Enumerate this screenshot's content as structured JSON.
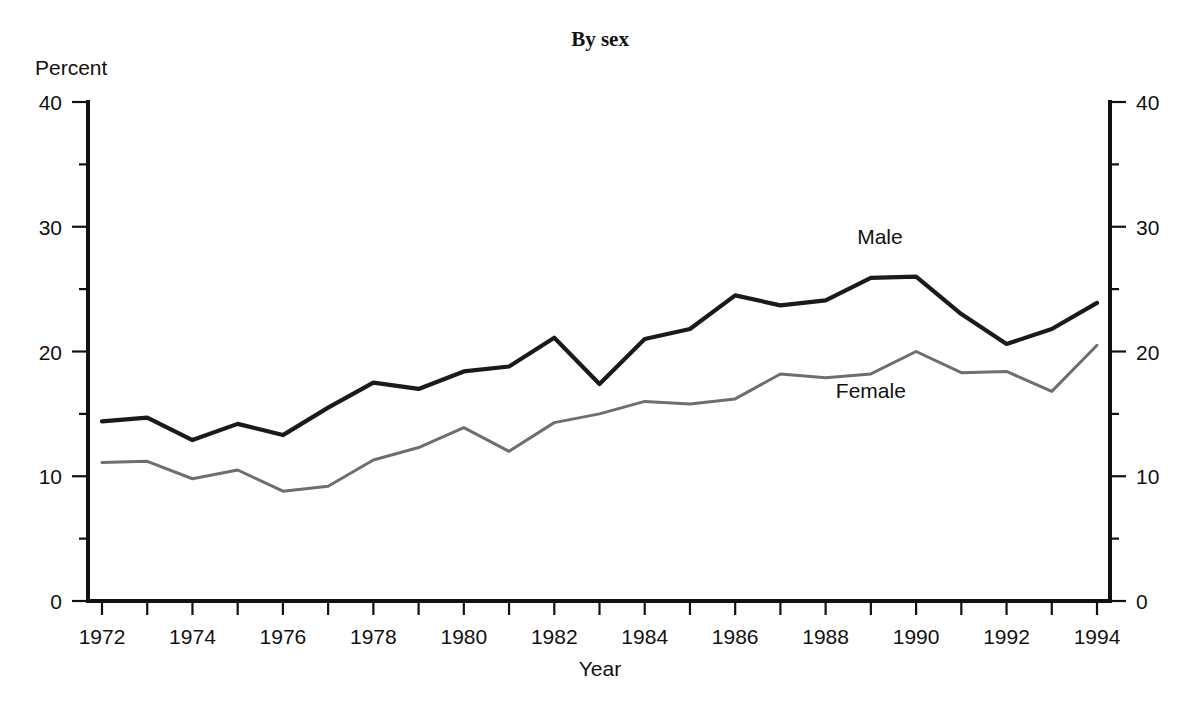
{
  "chart_data": {
    "type": "line",
    "title": "By sex",
    "xlabel": "Year",
    "ylabel": "Percent",
    "ylim": [
      0,
      40
    ],
    "xlim": [
      1972,
      1994
    ],
    "grid": false,
    "legend_position": "inline-annotations",
    "y_ticks_major": [
      0,
      10,
      20,
      30,
      40
    ],
    "y_ticks_minor": [
      5,
      15,
      25,
      35
    ],
    "y_tick_labels": [
      "0",
      "10",
      "20",
      "30",
      "40"
    ],
    "y_axis_right_labels": [
      "0",
      "10",
      "20",
      "30",
      "40"
    ],
    "x_ticks": [
      1972,
      1973,
      1974,
      1975,
      1976,
      1977,
      1978,
      1979,
      1980,
      1981,
      1982,
      1983,
      1984,
      1985,
      1986,
      1987,
      1988,
      1989,
      1990,
      1991,
      1992,
      1993,
      1994
    ],
    "x_tick_labels": [
      "1972",
      "",
      "1974",
      "",
      "1976",
      "",
      "1978",
      "",
      "1980",
      "",
      "1982",
      "",
      "1984",
      "",
      "1986",
      "",
      "1988",
      "",
      "1990",
      "",
      "1992",
      "",
      "1994"
    ],
    "x": [
      1972,
      1973,
      1974,
      1975,
      1976,
      1977,
      1978,
      1979,
      1980,
      1981,
      1982,
      1983,
      1984,
      1985,
      1986,
      1987,
      1988,
      1989,
      1990,
      1991,
      1992,
      1993,
      1994
    ],
    "series": [
      {
        "name": "Male",
        "color": "#1a1a1a",
        "width": 4.2,
        "label_x": 1989.2,
        "label_y": 28.6,
        "values": [
          14.4,
          14.7,
          12.9,
          14.2,
          13.3,
          15.5,
          17.5,
          17.0,
          18.4,
          18.8,
          21.1,
          17.4,
          21.0,
          21.8,
          24.5,
          23.7,
          24.1,
          25.9,
          26.0,
          23.0,
          20.6,
          21.8,
          23.9
        ]
      },
      {
        "name": "Female",
        "color": "#6e6e6e",
        "width": 3.0,
        "label_x": 1989.0,
        "label_y": 16.3,
        "values": [
          11.1,
          11.2,
          9.8,
          10.5,
          8.8,
          9.2,
          11.3,
          12.3,
          13.9,
          12.0,
          14.3,
          15.0,
          16.0,
          15.8,
          16.2,
          18.2,
          17.9,
          18.2,
          20.0,
          18.3,
          18.4,
          16.8,
          20.5
        ]
      }
    ]
  },
  "labels": {
    "title": "By sex",
    "y_axis_title": "Percent",
    "x_axis_title": "Year",
    "series_male": "Male",
    "series_female": "Female"
  }
}
